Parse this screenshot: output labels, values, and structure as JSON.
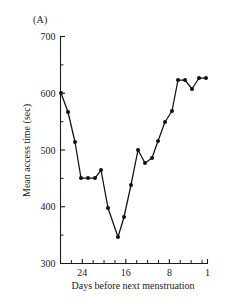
{
  "figure": {
    "panel_label": "(A)",
    "ylabel": "Mean access time (sec)",
    "xlabel": "Days before next menstruation"
  },
  "chart_data": {
    "type": "line",
    "title": "(A)",
    "xlabel": "Days before next menstruation",
    "ylabel": "Mean access time (sec)",
    "xlim": [
      28,
      1
    ],
    "ylim": [
      300,
      700
    ],
    "x_ticks": [
      24,
      16,
      8,
      1
    ],
    "y_ticks": [
      300,
      400,
      500,
      600,
      700
    ],
    "y_minor_ticks": [
      350,
      450,
      550,
      650
    ],
    "x_axis_direction": "descending",
    "grid": false,
    "legend": null,
    "markers": "filled-circle",
    "x": [
      28,
      27,
      26,
      25,
      24,
      23,
      22,
      21,
      20,
      19,
      18,
      17,
      16,
      15,
      14,
      13,
      12,
      11,
      10,
      9,
      8,
      7,
      6,
      5,
      4,
      3,
      2,
      1
    ],
    "values": [
      600,
      567,
      513,
      450,
      449,
      449,
      449,
      470,
      407,
      345,
      380,
      380,
      437,
      437,
      518,
      518,
      492,
      492,
      500,
      520,
      555,
      555,
      575,
      575,
      622,
      622,
      605,
      620
    ],
    "series": [
      {
        "name": "Mean access time",
        "points": [
          {
            "day": 28,
            "value": 600
          },
          {
            "day": 27,
            "value": 567
          },
          {
            "day": 26,
            "value": 513
          },
          {
            "day": 25,
            "value": 450
          },
          {
            "day": 24,
            "value": 449
          },
          {
            "day": 23,
            "value": 449
          },
          {
            "day": 22,
            "value": 470
          },
          {
            "day": 21,
            "value": 407
          },
          {
            "day": 20,
            "value": 345
          },
          {
            "day": 19,
            "value": 380
          },
          {
            "day": 18,
            "value": 437
          },
          {
            "day": 17,
            "value": 518
          },
          {
            "day": 16,
            "value": 492
          },
          {
            "day": 15,
            "value": 500
          },
          {
            "day": 14,
            "value": 520
          },
          {
            "day": 13,
            "value": 555
          },
          {
            "day": 12,
            "value": 575
          },
          {
            "day": 11,
            "value": 622
          },
          {
            "day": 10,
            "value": 605
          },
          {
            "day": 9,
            "value": 620
          }
        ]
      }
    ],
    "plot_points_px": [
      [
        61,
        93
      ],
      [
        68,
        112
      ],
      [
        75,
        142
      ],
      [
        81,
        178
      ],
      [
        88,
        178
      ],
      [
        95,
        178
      ],
      [
        101,
        170
      ],
      [
        108,
        208
      ],
      [
        118,
        237
      ],
      [
        124,
        217
      ],
      [
        131,
        185
      ],
      [
        138,
        150
      ],
      [
        145,
        163
      ],
      [
        152,
        158
      ],
      [
        158,
        141
      ],
      [
        165,
        122
      ],
      [
        172,
        111
      ],
      [
        178,
        80
      ],
      [
        185,
        80
      ],
      [
        192,
        89
      ],
      [
        199,
        78
      ],
      [
        206,
        78
      ]
    ]
  }
}
